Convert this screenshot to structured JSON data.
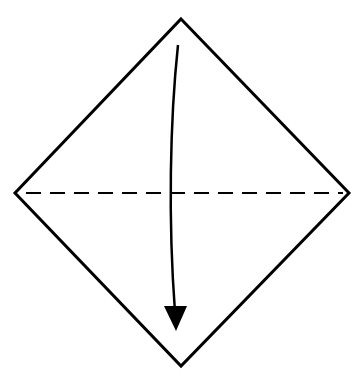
{
  "diagram": {
    "type": "origami-fold-step",
    "shape": "diamond",
    "colors": {
      "background": "#ffffff",
      "stroke": "#000000"
    },
    "vertices": {
      "top": [
        181,
        19
      ],
      "right": [
        349,
        193
      ],
      "bottom": [
        181,
        366
      ],
      "left": [
        15,
        193
      ]
    },
    "fold_line": {
      "style": "valley-dashed",
      "from": [
        26,
        193
      ],
      "to": [
        343,
        193
      ],
      "dash": [
        15,
        9
      ]
    },
    "arrow": {
      "direction": "down",
      "meaning": "fold top corner down to bottom corner",
      "start": [
        178,
        45
      ],
      "tip": [
        176,
        330
      ]
    }
  }
}
